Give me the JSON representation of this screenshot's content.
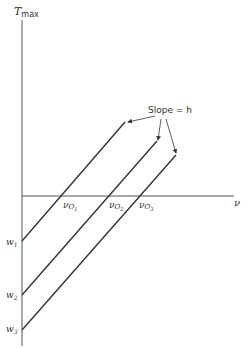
{
  "diagram": {
    "y_axis_label": "T",
    "y_axis_label_sub": "max",
    "x_axis_label": "ν",
    "annotation": "Slope = h",
    "threshold_labels": [
      {
        "main": "ν",
        "sub": "O",
        "idx": "1"
      },
      {
        "main": "ν",
        "sub": "O",
        "idx": "2"
      },
      {
        "main": "ν",
        "sub": "O",
        "idx": "3"
      }
    ],
    "intercept_labels": [
      {
        "main": "w",
        "idx": "1"
      },
      {
        "main": "w",
        "idx": "2"
      },
      {
        "main": "w",
        "idx": "3"
      }
    ],
    "lines": [
      {
        "x1": 22,
        "y1": 241,
        "x2": 125,
        "y2": 122
      },
      {
        "x1": 22,
        "y1": 295,
        "x2": 157,
        "y2": 141
      },
      {
        "x1": 22,
        "y1": 330,
        "x2": 176,
        "y2": 155
      }
    ],
    "color": "#333333"
  }
}
